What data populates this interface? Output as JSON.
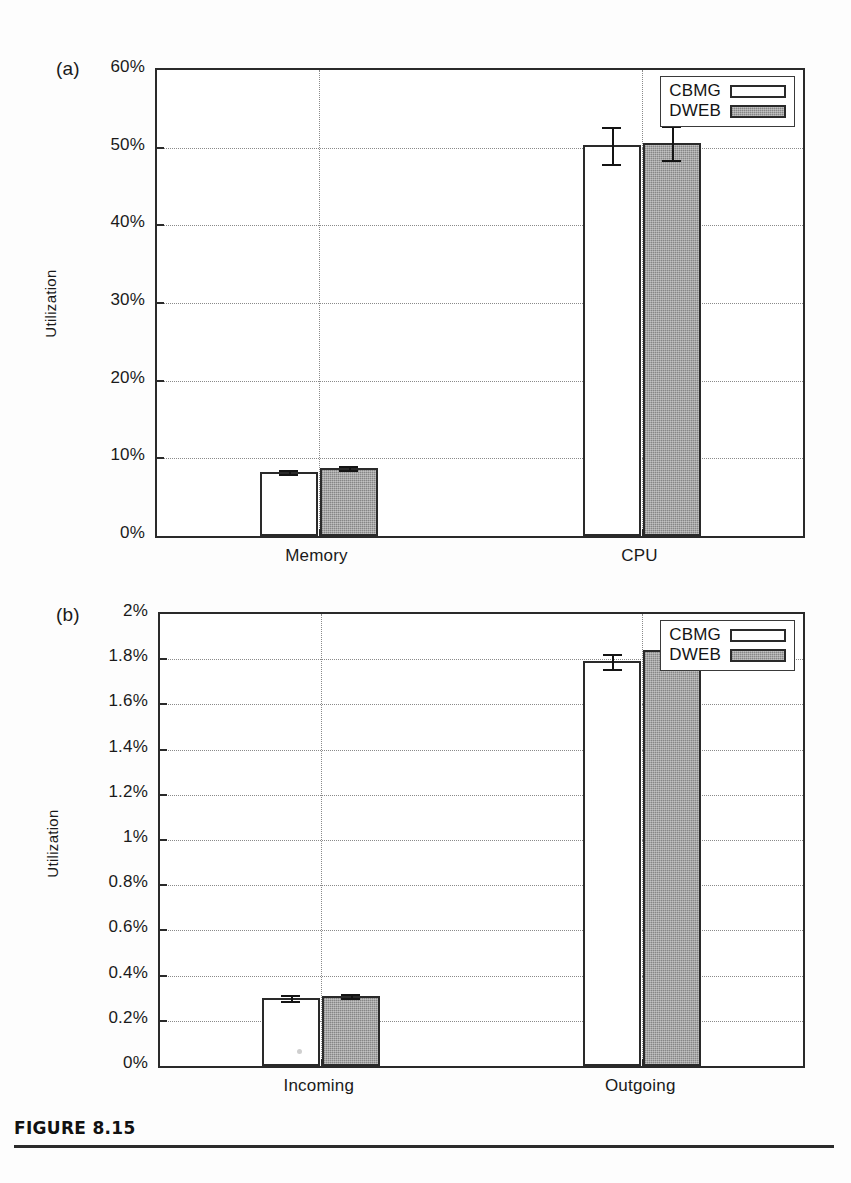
{
  "figure": {
    "caption_title": "FIGURE 8.15",
    "legend_title_cbmg": "CBMG",
    "legend_title_dweb": "DWEB",
    "colors": {
      "cbmg_fill": "#ffffff",
      "dweb_fill": "#9c9c9c",
      "axis": "#2a2a2a",
      "grid": "#8a8a8a"
    }
  },
  "chart_data": [
    {
      "type": "bar",
      "panel": "(a)",
      "title": "",
      "xlabel": "",
      "ylabel": "Utilization",
      "categories": [
        "Memory",
        "CPU"
      ],
      "ylim": [
        0,
        60
      ],
      "ytick_values": [
        0,
        10,
        20,
        30,
        40,
        50,
        60
      ],
      "ytick_labels": [
        "0%",
        "10%",
        "20%",
        "30%",
        "40%",
        "50%",
        "60%"
      ],
      "grid": true,
      "legend_position": "top-right",
      "series": [
        {
          "name": "CBMG",
          "values": [
            8.2,
            50.3
          ],
          "errors": [
            0.25,
            2.4
          ],
          "fill": "white"
        },
        {
          "name": "DWEB",
          "values": [
            8.7,
            50.6
          ],
          "errors": [
            0.25,
            2.2
          ],
          "fill": "gray"
        }
      ]
    },
    {
      "type": "bar",
      "panel": "(b)",
      "title": "",
      "xlabel": "",
      "ylabel": "Utilization",
      "categories": [
        "Incoming",
        "Outgoing"
      ],
      "ylim": [
        0,
        2
      ],
      "ytick_values": [
        0,
        0.2,
        0.4,
        0.6,
        0.8,
        1.0,
        1.2,
        1.4,
        1.6,
        1.8,
        2.0
      ],
      "ytick_labels": [
        "0%",
        "0.2%",
        "0.4%",
        "0.6%",
        "0.8%",
        "1%",
        "1.2%",
        "1.4%",
        "1.6%",
        "1.8%",
        "2%"
      ],
      "grid": true,
      "legend_position": "top-right",
      "series": [
        {
          "name": "CBMG",
          "values": [
            0.3,
            1.79
          ],
          "errors": [
            0.012,
            0.035
          ],
          "fill": "white"
        },
        {
          "name": "DWEB",
          "values": [
            0.31,
            1.84
          ],
          "errors": [
            0.01,
            0.025
          ],
          "fill": "gray"
        }
      ]
    }
  ]
}
